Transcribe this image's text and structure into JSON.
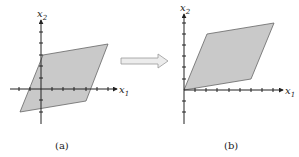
{
  "figure": {
    "panels": [
      {
        "id": "a",
        "caption": "(a)",
        "x_axis_label": "x",
        "x_axis_sub": "1",
        "y_axis_label": "x",
        "y_axis_sub": "2",
        "parallelogram_vertices": [
          [
            -2,
            -2
          ],
          [
            4,
            -1
          ],
          [
            6,
            4
          ],
          [
            0,
            3
          ]
        ]
      },
      {
        "id": "b",
        "caption": "(b)",
        "x_axis_label": "x",
        "x_axis_sub": "1",
        "y_axis_label": "x",
        "y_axis_sub": "2",
        "parallelogram_vertices": [
          [
            0,
            0
          ],
          [
            6,
            1
          ],
          [
            8,
            6
          ],
          [
            2,
            5
          ]
        ]
      }
    ],
    "arrow": {
      "direction": "right",
      "color": "#d0d0d0"
    },
    "colors": {
      "fill": "#c9c9c9",
      "axis": "#222222"
    }
  }
}
